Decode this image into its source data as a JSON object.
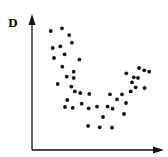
{
  "chart_data": {
    "type": "scatter",
    "title": "",
    "xlabel": "",
    "ylabel": "D",
    "xlim": [
      0,
      100
    ],
    "ylim": [
      0,
      100
    ],
    "grid": false,
    "legend": null,
    "ticks": false,
    "colors": {
      "points": "#111111",
      "axes": "#111111"
    },
    "series": [
      {
        "name": "points",
        "points": [
          [
            14.6,
            93.0
          ],
          [
            23.4,
            95.1
          ],
          [
            29.1,
            89.8
          ],
          [
            31.2,
            83.8
          ],
          [
            16.2,
            79.7
          ],
          [
            22.1,
            81.0
          ],
          [
            25.5,
            74.8
          ],
          [
            17.2,
            71.9
          ],
          [
            37.0,
            70.6
          ],
          [
            23.7,
            65.1
          ],
          [
            32.6,
            61.2
          ],
          [
            27.1,
            57.3
          ],
          [
            32.6,
            56.3
          ],
          [
            20.1,
            51.6
          ],
          [
            30.7,
            49.5
          ],
          [
            33.4,
            45.8
          ],
          [
            37.7,
            44.5
          ],
          [
            44.8,
            43.8
          ],
          [
            27.6,
            39.1
          ],
          [
            38.8,
            36.2
          ],
          [
            25.8,
            33.6
          ],
          [
            31.8,
            33.0
          ],
          [
            44.3,
            32.6
          ],
          [
            50.8,
            33.9
          ],
          [
            43.8,
            18.8
          ],
          [
            52.9,
            17.7
          ],
          [
            62.5,
            17.4
          ],
          [
            55.5,
            25.8
          ],
          [
            59.1,
            33.9
          ],
          [
            63.0,
            32.3
          ],
          [
            60.9,
            43.5
          ],
          [
            66.4,
            39.6
          ],
          [
            70.3,
            43.5
          ],
          [
            73.4,
            36.7
          ],
          [
            71.9,
            28.1
          ],
          [
            73.7,
            59.9
          ],
          [
            77.1,
            45.8
          ],
          [
            78.1,
            52.9
          ],
          [
            79.5,
            56.8
          ],
          [
            81.0,
            49.0
          ],
          [
            82.8,
            56.3
          ],
          [
            83.6,
            64.1
          ],
          [
            87.7,
            62.3
          ],
          [
            91.6,
            61.2
          ],
          [
            88.0,
            48.4
          ]
        ]
      }
    ]
  }
}
